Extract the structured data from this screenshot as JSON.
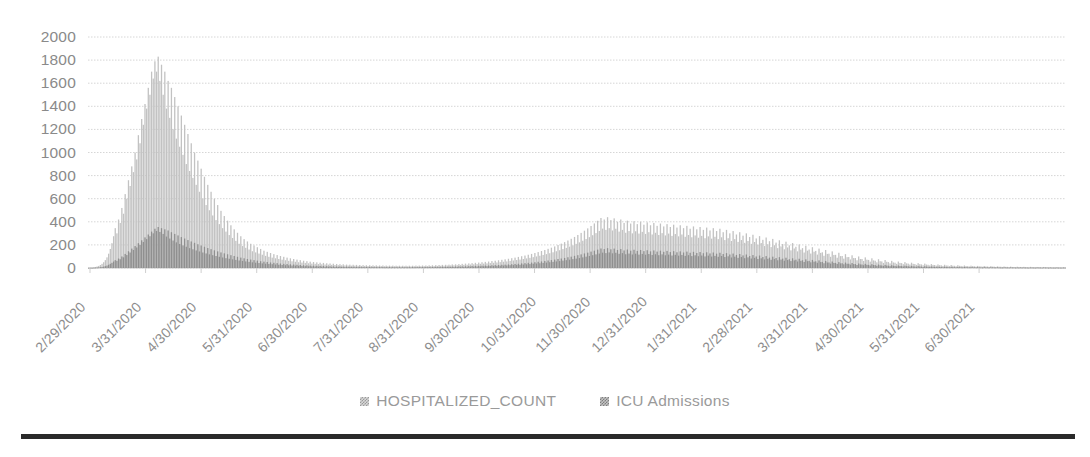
{
  "chart_data": {
    "type": "bar",
    "title": "",
    "subtitle": "",
    "xlabel": "",
    "ylabel": "",
    "ylim": [
      0,
      2000
    ],
    "ytick_step": 200,
    "yticks": [
      "2000",
      "1800",
      "1600",
      "1400",
      "1200",
      "1000",
      "800",
      "600",
      "400",
      "200",
      "0"
    ],
    "grid": true,
    "legend_position": "bottom",
    "xtick_labels": [
      "2/29/2020",
      "3/31/2020",
      "4/30/2020",
      "5/31/2020",
      "6/30/2020",
      "7/31/2020",
      "8/31/2020",
      "9/30/2020",
      "10/31/2020",
      "11/30/2020",
      "12/31/2020",
      "1/31/2021",
      "2/28/2021",
      "3/31/2021",
      "4/30/2021",
      "5/31/2021",
      "6/30/2021"
    ],
    "series": [
      {
        "name": "HOSPITALIZED_COUNT",
        "color": "#c2c2c2",
        "values": [
          2,
          3,
          4,
          6,
          9,
          13,
          18,
          26,
          36,
          50,
          68,
          92,
          124,
          165,
          215,
          275,
          345,
          300,
          420,
          390,
          520,
          470,
          640,
          600,
          760,
          710,
          880,
          830,
          1000,
          940,
          1150,
          1080,
          1290,
          1240,
          1420,
          1380,
          1560,
          1500,
          1700,
          1640,
          1790,
          1700,
          1830,
          1620,
          1760,
          1500,
          1700,
          1380,
          1620,
          1300,
          1560,
          1200,
          1480,
          1120,
          1400,
          1050,
          1320,
          980,
          1240,
          900,
          1160,
          840,
          1080,
          780,
          1000,
          720,
          930,
          660,
          860,
          600,
          790,
          545,
          720,
          500,
          660,
          455,
          600,
          415,
          545,
          380,
          495,
          345,
          450,
          315,
          410,
          285,
          370,
          260,
          335,
          235,
          305,
          210,
          275,
          190,
          250,
          175,
          230,
          160,
          210,
          145,
          195,
          135,
          180,
          125,
          165,
          115,
          150,
          105,
          140,
          97,
          130,
          90,
          120,
          84,
          112,
          78,
          104,
          72,
          97,
          67,
          90,
          62,
          84,
          58,
          78,
          54,
          73,
          50,
          68,
          47,
          63,
          44,
          59,
          41,
          55,
          38,
          52,
          36,
          49,
          34,
          46,
          32,
          44,
          30,
          41,
          29,
          39,
          27,
          37,
          26,
          35,
          24,
          33,
          23,
          32,
          22,
          30,
          21,
          29,
          20,
          28,
          20,
          27,
          19,
          26,
          18,
          25,
          18,
          24,
          17,
          24,
          17,
          23,
          16,
          23,
          16,
          22,
          16,
          22,
          15,
          21,
          15,
          21,
          15,
          21,
          15,
          20,
          15,
          20,
          14,
          20,
          14,
          20,
          14,
          20,
          14,
          20,
          15,
          21,
          15,
          21,
          15,
          22,
          16,
          22,
          16,
          23,
          17,
          24,
          17,
          25,
          18,
          26,
          19,
          27,
          20,
          28,
          21,
          29,
          22,
          31,
          23,
          32,
          24,
          34,
          25,
          36,
          27,
          38,
          28,
          40,
          30,
          42,
          32,
          45,
          34,
          47,
          36,
          50,
          38,
          53,
          40,
          56,
          43,
          60,
          45,
          63,
          48,
          67,
          51,
          71,
          54,
          75,
          57,
          80,
          61,
          85,
          65,
          90,
          69,
          96,
          73,
          102,
          78,
          108,
          83,
          115,
          88,
          122,
          94,
          130,
          100,
          138,
          106,
          147,
          113,
          156,
          120,
          166,
          128,
          176,
          136,
          187,
          145,
          199,
          154,
          211,
          164,
          224,
          174,
          238,
          185,
          253,
          197,
          269,
          209,
          286,
          222,
          304,
          236,
          323,
          251,
          343,
          267,
          364,
          284,
          386,
          302,
          409,
          321,
          433,
          341,
          420,
          330,
          440,
          345,
          415,
          325,
          430,
          340,
          400,
          315,
          420,
          330,
          390,
          305,
          410,
          320,
          385,
          300,
          405,
          318,
          380,
          298,
          400,
          313,
          375,
          295,
          395,
          310,
          370,
          290,
          390,
          305,
          365,
          286,
          385,
          302,
          360,
          282,
          380,
          298,
          355,
          278,
          375,
          294,
          350,
          274,
          370,
          290,
          345,
          270,
          365,
          286,
          340,
          266,
          360,
          282,
          335,
          262,
          355,
          278,
          330,
          258,
          350,
          274,
          325,
          254,
          345,
          270,
          320,
          250,
          340,
          266,
          310,
          242,
          330,
          258,
          300,
          234,
          320,
          250,
          290,
          226,
          310,
          242,
          280,
          218,
          300,
          234,
          268,
          209,
          288,
          225,
          256,
          200,
          276,
          216,
          244,
          190,
          264,
          206,
          232,
          181,
          252,
          197,
          220,
          172,
          240,
          187,
          208,
          162,
          228,
          178,
          196,
          153,
          216,
          169,
          184,
          144,
          204,
          159,
          172,
          134,
          192,
          150,
          160,
          125,
          180,
          141,
          148,
          116,
          168,
          131,
          136,
          106,
          156,
          122,
          124,
          97,
          144,
          113,
          114,
          89,
          132,
          103,
          104,
          81,
          120,
          94,
          95,
          74,
          110,
          86,
          86,
          67,
          100,
          78,
          78,
          61,
          92,
          72,
          70,
          55,
          84,
          66,
          63,
          49,
          76,
          59,
          57,
          44,
          69,
          54,
          51,
          40,
          62,
          48,
          46,
          36,
          56,
          44,
          42,
          33,
          51,
          40,
          38,
          30,
          46,
          36,
          34,
          27,
          42,
          33,
          31,
          24,
          38,
          30,
          28,
          22,
          34,
          27,
          26,
          20,
          31,
          24,
          23,
          18,
          28,
          22,
          21,
          16,
          26,
          20,
          19,
          15,
          24,
          19,
          18,
          14,
          22,
          17,
          16,
          13,
          20,
          16,
          15,
          12,
          18,
          14,
          14,
          11,
          17,
          13,
          13,
          10,
          16,
          12,
          12,
          9,
          14,
          11,
          11,
          9,
          13,
          10,
          10,
          8,
          12,
          9,
          9,
          7,
          11,
          9,
          9,
          7,
          10,
          8,
          8,
          6,
          10,
          8,
          8,
          6,
          9,
          7,
          7,
          6,
          9,
          7,
          7,
          5,
          8,
          6,
          6,
          5,
          8,
          6,
          6,
          5,
          7,
          6
        ]
      },
      {
        "name": "ICU Admissions",
        "color": "#8f8f8f",
        "values": [
          1,
          1,
          1,
          2,
          3,
          4,
          5,
          7,
          9,
          12,
          16,
          21,
          28,
          36,
          45,
          56,
          68,
          62,
          82,
          76,
          100,
          92,
          122,
          112,
          145,
          134,
          168,
          156,
          190,
          178,
          215,
          200,
          240,
          225,
          265,
          250,
          290,
          275,
          315,
          300,
          340,
          320,
          355,
          312,
          345,
          295,
          335,
          272,
          325,
          255,
          310,
          238,
          295,
          222,
          282,
          208,
          268,
          196,
          255,
          184,
          242,
          172,
          230,
          162,
          218,
          152,
          206,
          143,
          195,
          134,
          184,
          126,
          173,
          118,
          163,
          111,
          153,
          104,
          144,
          97,
          135,
          91,
          127,
          85,
          119,
          80,
          111,
          75,
          104,
          70,
          97,
          65,
          90,
          61,
          84,
          57,
          78,
          53,
          73,
          49,
          68,
          46,
          64,
          43,
          59,
          40,
          55,
          37,
          52,
          35,
          48,
          33,
          45,
          30,
          42,
          28,
          39,
          26,
          36,
          24,
          34,
          23,
          32,
          21,
          30,
          20,
          28,
          19,
          26,
          18,
          24,
          16,
          23,
          15,
          21,
          14,
          20,
          13,
          19,
          12,
          18,
          12,
          17,
          11,
          16,
          11,
          15,
          10,
          14,
          10,
          13,
          9,
          13,
          9,
          12,
          8,
          12,
          8,
          11,
          8,
          11,
          7,
          10,
          7,
          10,
          7,
          9,
          6,
          9,
          6,
          9,
          6,
          9,
          6,
          8,
          6,
          8,
          6,
          8,
          5,
          8,
          5,
          8,
          5,
          8,
          5,
          7,
          5,
          7,
          5,
          7,
          5,
          7,
          5,
          7,
          5,
          8,
          5,
          8,
          6,
          8,
          6,
          8,
          6,
          9,
          6,
          9,
          6,
          9,
          7,
          10,
          7,
          10,
          7,
          11,
          8,
          11,
          8,
          12,
          8,
          12,
          9,
          13,
          9,
          14,
          10,
          14,
          10,
          15,
          11,
          16,
          12,
          17,
          12,
          18,
          13,
          19,
          14,
          20,
          15,
          21,
          16,
          22,
          17,
          24,
          18,
          25,
          19,
          26,
          20,
          28,
          21,
          29,
          22,
          31,
          24,
          33,
          25,
          35,
          27,
          37,
          28,
          40,
          30,
          42,
          32,
          45,
          34,
          47,
          37,
          50,
          39,
          54,
          41,
          57,
          44,
          61,
          47,
          65,
          50,
          69,
          53,
          73,
          57,
          78,
          60,
          82,
          64,
          87,
          68,
          93,
          72,
          98,
          77,
          105,
          81,
          111,
          86,
          118,
          92,
          126,
          98,
          133,
          104,
          142,
          111,
          150,
          118,
          159,
          125,
          169,
          133,
          164,
          129,
          172,
          135,
          162,
          127,
          168,
          132,
          156,
          123,
          164,
          129,
          152,
          119,
          160,
          125,
          150,
          117,
          158,
          124,
          148,
          116,
          156,
          122,
          146,
          115,
          154,
          121,
          144,
          113,
          152,
          119,
          142,
          111,
          150,
          118,
          140,
          110,
          148,
          116,
          138,
          108,
          146,
          114,
          136,
          107,
          144,
          113,
          134,
          105,
          142,
          111,
          132,
          103,
          140,
          110,
          130,
          102,
          138,
          108,
          128,
          100,
          136,
          107,
          126,
          99,
          134,
          105,
          124,
          97,
          132,
          104,
          121,
          95,
          129,
          101,
          117,
          91,
          125,
          98,
          113,
          88,
          121,
          95,
          109,
          85,
          117,
          92,
          104,
          82,
          112,
          88,
          100,
          78,
          108,
          84,
          95,
          74,
          103,
          80,
          90,
          71,
          98,
          77,
          86,
          67,
          94,
          73,
          81,
          63,
          89,
          69,
          76,
          60,
          84,
          66,
          72,
          56,
          80,
          62,
          67,
          52,
          75,
          59,
          62,
          49,
          70,
          55,
          58,
          45,
          66,
          51,
          53,
          41,
          61,
          48,
          48,
          38,
          56,
          44,
          44,
          35,
          51,
          40,
          41,
          32,
          47,
          37,
          37,
          29,
          43,
          34,
          34,
          26,
          39,
          31,
          30,
          24,
          36,
          28,
          27,
          21,
          33,
          26,
          25,
          19,
          30,
          23,
          22,
          17,
          27,
          21,
          20,
          16,
          24,
          19,
          18,
          14,
          22,
          17,
          16,
          13,
          20,
          16,
          15,
          12,
          18,
          14,
          13,
          11,
          16,
          13,
          12,
          9,
          15,
          12,
          11,
          9,
          13,
          11,
          10,
          8,
          12,
          9,
          9,
          7,
          11,
          9,
          8,
          6,
          10,
          8,
          7,
          6,
          9,
          7,
          7,
          5,
          9,
          7,
          6,
          5,
          8,
          6,
          6,
          5,
          7,
          5,
          5,
          4,
          7,
          5,
          5,
          4,
          6,
          5,
          5,
          4,
          6,
          4,
          4,
          3,
          5,
          4,
          4,
          3,
          5,
          4,
          4,
          3,
          4,
          3,
          4,
          3,
          4,
          3,
          3,
          2,
          4,
          3,
          3,
          2,
          4,
          3,
          3,
          2,
          4,
          3,
          3,
          2,
          3,
          2,
          2,
          2,
          3,
          2,
          2,
          2,
          3,
          2
        ]
      }
    ]
  },
  "legend": {
    "items": [
      {
        "label": "HOSPITALIZED_COUNT"
      },
      {
        "label": "ICU Admissions"
      }
    ]
  }
}
